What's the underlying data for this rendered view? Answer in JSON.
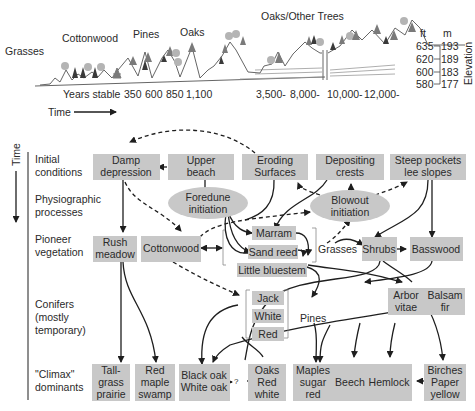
{
  "top_panel": {
    "vegetation_labels": [
      "Grasses",
      "Cottonwood",
      "Pines",
      "Oaks",
      "Oaks/Other Trees"
    ],
    "years_label": "Years stable",
    "years": [
      "350",
      "600",
      "850",
      "1,100",
      "3,500-",
      "8,000-",
      "10,000-",
      "12,000-"
    ],
    "time_label": "Time",
    "elevation": {
      "title": "Elevation",
      "ft_header": "ft",
      "m_header": "m",
      "ft": [
        "635",
        "620",
        "600",
        "580"
      ],
      "m": [
        "193",
        "189",
        "183",
        "177"
      ]
    }
  },
  "rows": {
    "time_label": "Time",
    "labels": [
      [
        "Initial",
        "conditions"
      ],
      [
        "Physiographic",
        "processes"
      ],
      [
        "Pioneer",
        "vegetation"
      ],
      [
        "Conifers",
        "(mostly",
        "temporary)"
      ],
      [
        "\"Climax\"",
        "dominants"
      ]
    ]
  },
  "nodes": {
    "damp_depression": [
      "Damp",
      "depression"
    ],
    "upper_beach": [
      "Upper",
      "beach"
    ],
    "eroding_surfaces": [
      "Eroding",
      "Surfaces"
    ],
    "depositing_crests": [
      "Depositing",
      "crests"
    ],
    "steep_pockets": [
      "Steep pockets",
      "lee slopes"
    ],
    "foredune": [
      "Foredune",
      "initiation"
    ],
    "blowout": [
      "Blowout",
      "initiation"
    ],
    "rush_meadow": [
      "Rush",
      "meadow"
    ],
    "cottonwood": [
      "Cottonwood"
    ],
    "marram": [
      "Marram"
    ],
    "sand_reed": [
      "Sand reed"
    ],
    "little_bluestem": [
      "Little bluestem"
    ],
    "grasses": [
      "Grasses"
    ],
    "shrubs": [
      "Shrubs"
    ],
    "basswood": [
      "Basswood"
    ],
    "jack": [
      "Jack"
    ],
    "white": [
      "White"
    ],
    "red": [
      "Red"
    ],
    "pines": [
      "Pines"
    ],
    "arbor_vitae": [
      "Arbor",
      "vitae"
    ],
    "balsam_fir": [
      "Balsam",
      "fir"
    ],
    "tallgrass_prairie": [
      "Tall-",
      "grass",
      "prairie"
    ],
    "red_maple_swamp": [
      "Red",
      "maple",
      "swamp"
    ],
    "black_white_oak": [
      "Black oak",
      "White oak"
    ],
    "oaks_red_white": [
      "Oaks",
      "Red",
      "white"
    ],
    "maples": [
      "Maples",
      "sugar",
      "red"
    ],
    "beech": [
      "Beech"
    ],
    "hemlock": [
      "Hemlock"
    ],
    "birches": [
      "Birches",
      "Paper",
      "yellow"
    ],
    "question": "?"
  },
  "colors": {
    "box_fill": "#c8c8c8",
    "line": "#1e1e1e",
    "tree_dark": "#3a3a3a",
    "tree_light": "#b4b4b4",
    "pine": "#7a7a7a"
  }
}
